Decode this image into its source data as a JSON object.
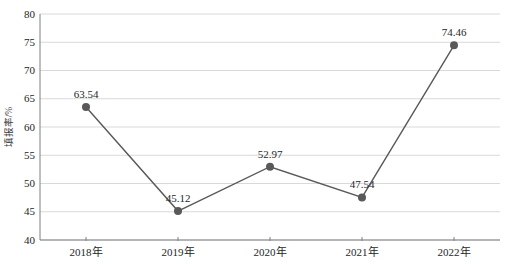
{
  "chart_data": {
    "type": "line",
    "title": "",
    "categories": [
      "2018年",
      "2019年",
      "2020年",
      "2021年",
      "2022年"
    ],
    "values": [
      63.54,
      45.12,
      52.97,
      47.54,
      74.46
    ],
    "data_labels": [
      "63.54",
      "45.12",
      "52.97",
      "47.54",
      "74.46"
    ],
    "xlabel": "",
    "ylabel": "填报率/%",
    "ylim": [
      40,
      80
    ],
    "yticks": [
      40,
      45,
      50,
      55,
      60,
      65,
      70,
      75,
      80
    ],
    "grid": "horizontal",
    "legend": "none",
    "colors": {
      "line": "#595959",
      "marker": "#595959",
      "gridline": "#d9d9d9",
      "axis": "#7f7f7f",
      "text": "#262626"
    }
  }
}
